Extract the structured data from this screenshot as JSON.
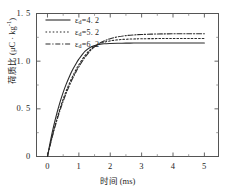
{
  "chart_data": {
    "type": "line",
    "title": "",
    "xlabel": "时间 (ms)",
    "ylabel": "荷质比 (μC · kg⁻¹)",
    "ylabel_main": "荷质比 (μC · kg",
    "ylabel_exp": "-1",
    "ylabel_tail": ")",
    "xlim": [
      -0.35,
      5.45
    ],
    "ylim": [
      0,
      1.5
    ],
    "xticks": [
      0,
      1,
      2,
      3,
      4,
      5
    ],
    "xticklabels": [
      "0",
      "1",
      "2",
      "3",
      "4",
      "5"
    ],
    "yticks": [
      0,
      0.5,
      1.0,
      1.5
    ],
    "yticklabels": [
      "0",
      "0. 5",
      "1. 0",
      "1. 5"
    ],
    "grid": false,
    "legend_position": "upper left",
    "series": [
      {
        "name": "ε_d=4.2",
        "symbol": "ε",
        "subscript": "d",
        "label_value": "=4. 2",
        "linestyle": "solid",
        "color": "#2b2b2b",
        "plateau": 1.15,
        "tau": 0.62,
        "x": [
          0,
          0.1,
          0.2,
          0.3,
          0.4,
          0.5,
          0.6,
          0.7,
          0.8,
          0.9,
          1.0,
          1.2,
          1.4,
          1.6,
          1.8,
          2.0,
          2.25,
          2.5,
          2.75,
          3.0,
          3.5,
          4.0,
          4.5,
          5.0
        ],
        "y": [
          0,
          0.172,
          0.323,
          0.455,
          0.571,
          0.673,
          0.762,
          0.84,
          0.909,
          0.968,
          1.021,
          1.105,
          1.151,
          1.172,
          1.182,
          1.186,
          1.188,
          1.189,
          1.19,
          1.19,
          1.19,
          1.19,
          1.19,
          1.19
        ]
      },
      {
        "name": "ε_d=5.2",
        "symbol": "ε",
        "subscript": "d",
        "label_value": "=5. 2",
        "linestyle": "dotted",
        "color": "#2b2b2b",
        "plateau": 1.22,
        "tau": 0.78,
        "x": [
          0,
          0.1,
          0.2,
          0.3,
          0.4,
          0.5,
          0.6,
          0.7,
          0.8,
          0.9,
          1.0,
          1.2,
          1.4,
          1.6,
          1.8,
          2.0,
          2.25,
          2.5,
          2.75,
          3.0,
          3.5,
          4.0,
          4.5,
          5.0
        ],
        "y": [
          0,
          0.146,
          0.278,
          0.397,
          0.505,
          0.602,
          0.69,
          0.769,
          0.84,
          0.905,
          0.963,
          1.061,
          1.131,
          1.172,
          1.198,
          1.213,
          1.224,
          1.23,
          1.233,
          1.235,
          1.237,
          1.238,
          1.238,
          1.238
        ]
      },
      {
        "name": "ε_d=6.2",
        "symbol": "ε",
        "subscript": "d",
        "label_value": "=6. 2",
        "linestyle": "dashdot",
        "color": "#2b2b2b",
        "plateau": 1.27,
        "tau": 0.86,
        "x": [
          0,
          0.1,
          0.2,
          0.3,
          0.4,
          0.5,
          0.6,
          0.7,
          0.8,
          0.9,
          1.0,
          1.2,
          1.4,
          1.6,
          1.8,
          2.0,
          2.25,
          2.5,
          2.75,
          3.0,
          3.5,
          4.0,
          4.5,
          5.0
        ],
        "y": [
          0,
          0.139,
          0.265,
          0.38,
          0.485,
          0.58,
          0.667,
          0.745,
          0.817,
          0.882,
          0.941,
          1.043,
          1.122,
          1.175,
          1.211,
          1.236,
          1.256,
          1.268,
          1.275,
          1.28,
          1.285,
          1.287,
          1.288,
          1.288
        ]
      }
    ]
  }
}
